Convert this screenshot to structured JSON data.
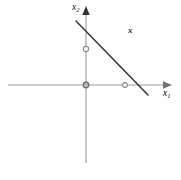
{
  "figure": {
    "background_color": "#ffffff",
    "axis_color": "#9a9a9a",
    "line_color": "#3a3a3a",
    "marker_color": "#8a8a8a",
    "text_color": "#111111"
  },
  "labels": {
    "x_axis": {
      "base": "x",
      "sub": "1",
      "full": "x1"
    },
    "y_axis": {
      "base": "x",
      "sub": "2",
      "full": "x2"
    },
    "set_label": "x"
  },
  "chart_data": {
    "type": "line",
    "title": "",
    "xlabel": "x1",
    "ylabel": "x2",
    "grid": false,
    "legend": false,
    "axis_style": "arrowed-cartesian-axes",
    "origin_px": {
      "x": 86,
      "y": 85
    },
    "x_axis_px": {
      "x_start": 8,
      "x_end": 172,
      "y": 85,
      "arrow": "right"
    },
    "y_axis_px": {
      "y_start": 10,
      "y_end": 163,
      "x": 86,
      "arrow": "up"
    },
    "series": [
      {
        "name": "constraint-line",
        "type": "segment",
        "points_px": [
          {
            "x": 76,
            "y": 21
          },
          {
            "x": 148,
            "y": 95
          }
        ]
      }
    ],
    "markers": [
      {
        "name": "y-intercept-marker",
        "x_px": 86,
        "y_px": 49,
        "shape": "open-circle"
      },
      {
        "name": "origin-marker",
        "x_px": 86,
        "y_px": 85,
        "shape": "open-circle"
      },
      {
        "name": "x-axis-marker",
        "x_px": 125,
        "y_px": 85,
        "shape": "open-circle"
      }
    ],
    "annotations": [
      {
        "name": "set-label",
        "text": "x",
        "x_px": 131,
        "y_px": 31,
        "style": "bold-italic"
      }
    ]
  },
  "artifacts": {
    "bottom_scan_noise": ""
  }
}
